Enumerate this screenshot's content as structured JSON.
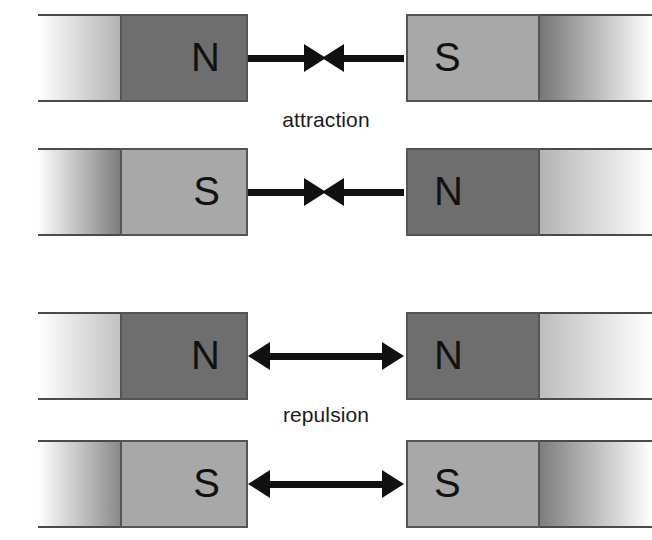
{
  "figure": {
    "width": 652,
    "height": 540,
    "background": "#ffffff",
    "pole_colors": {
      "north": "#6e6e6e",
      "south": "#a8a8a8",
      "edge": "#555555",
      "rule": "#4a4a4a",
      "arrow": "#111111",
      "fade_to": "#ffffff"
    }
  },
  "captions": [
    {
      "text": "attraction",
      "top": 108
    },
    {
      "text": "repulsion",
      "top": 403
    }
  ],
  "rows": [
    {
      "id": "row-attraction-n-s",
      "interaction": "attraction",
      "top": 14,
      "height": 88,
      "left_magnet": {
        "pole": "N",
        "pole_kind": "north",
        "pole_fill": "#6e6e6e",
        "tail_gradient_from": "#ffffff",
        "tail_gradient_to": "#b3b3b3",
        "tail_width": 82,
        "pole_width": 128,
        "offset": 38
      },
      "right_magnet": {
        "pole": "S",
        "pole_kind": "south",
        "pole_fill": "#a8a8a8",
        "tail_gradient_from": "#767676",
        "tail_gradient_to": "#ffffff",
        "tail_width": 112,
        "pole_width": 134,
        "offset": 0
      },
      "left_arrow": {
        "direction": "right",
        "left": 248,
        "width": 78
      },
      "right_arrow": {
        "direction": "left",
        "left": 322,
        "width": 82
      }
    },
    {
      "id": "row-attraction-s-n",
      "interaction": "attraction",
      "top": 148,
      "height": 88,
      "left_magnet": {
        "pole": "S",
        "pole_kind": "south",
        "pole_fill": "#a8a8a8",
        "tail_gradient_from": "#ffffff",
        "tail_gradient_to": "#7d7d7d",
        "tail_width": 82,
        "pole_width": 128,
        "offset": 38
      },
      "right_magnet": {
        "pole": "N",
        "pole_kind": "north",
        "pole_fill": "#6e6e6e",
        "tail_gradient_from": "#b3b3b3",
        "tail_gradient_to": "#ffffff",
        "tail_width": 112,
        "pole_width": 134,
        "offset": 0
      },
      "left_arrow": {
        "direction": "right",
        "left": 248,
        "width": 78
      },
      "right_arrow": {
        "direction": "left",
        "left": 322,
        "width": 82
      }
    },
    {
      "id": "row-repulsion-n-n",
      "interaction": "repulsion",
      "top": 312,
      "height": 88,
      "left_magnet": {
        "pole": "N",
        "pole_kind": "north",
        "pole_fill": "#6e6e6e",
        "tail_gradient_from": "#ffffff",
        "tail_gradient_to": "#c2c2c2",
        "tail_width": 82,
        "pole_width": 128,
        "offset": 38
      },
      "right_magnet": {
        "pole": "N",
        "pole_kind": "north",
        "pole_fill": "#6e6e6e",
        "tail_gradient_from": "#bdbdbd",
        "tail_gradient_to": "#ffffff",
        "tail_width": 112,
        "pole_width": 134,
        "offset": 0
      },
      "left_arrow": {
        "direction": "left",
        "left": 248,
        "width": 78
      },
      "right_arrow": {
        "direction": "right",
        "left": 322,
        "width": 82
      }
    },
    {
      "id": "row-repulsion-s-s",
      "interaction": "repulsion",
      "top": 440,
      "height": 88,
      "left_magnet": {
        "pole": "S",
        "pole_kind": "south",
        "pole_fill": "#a8a8a8",
        "tail_gradient_from": "#ffffff",
        "tail_gradient_to": "#8a8a8a",
        "tail_width": 82,
        "pole_width": 128,
        "offset": 38
      },
      "right_magnet": {
        "pole": "S",
        "pole_kind": "south",
        "pole_fill": "#a8a8a8",
        "tail_gradient_from": "#7d7d7d",
        "tail_gradient_to": "#ffffff",
        "tail_width": 112,
        "pole_width": 134,
        "offset": 0
      },
      "left_arrow": {
        "direction": "left",
        "left": 248,
        "width": 78
      },
      "right_arrow": {
        "direction": "right",
        "left": 322,
        "width": 82
      }
    }
  ],
  "diagram_meta": {
    "type": "diagram",
    "subject": "bar magnet pole interactions",
    "pole_labels": [
      "N",
      "S"
    ],
    "interaction_labels": [
      "attraction",
      "repulsion"
    ]
  }
}
